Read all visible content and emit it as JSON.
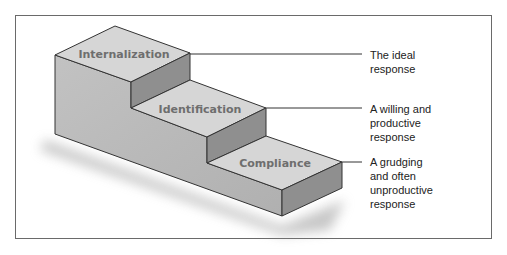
{
  "diagram": {
    "steps": [
      {
        "label": "Internalization",
        "response": "The ideal\nresponse"
      },
      {
        "label": "Identification",
        "response": "A willing and\nproductive\nresponse"
      },
      {
        "label": "Compliance",
        "response": "A grudging\nand often\nunproductive\nresponse"
      }
    ],
    "colors": {
      "top_face": "#d6d6d6",
      "left_face": "#b9b9b9",
      "riser_face": "#8f8f8f",
      "edge": "#333333",
      "frame": "#6a6a6a"
    }
  }
}
